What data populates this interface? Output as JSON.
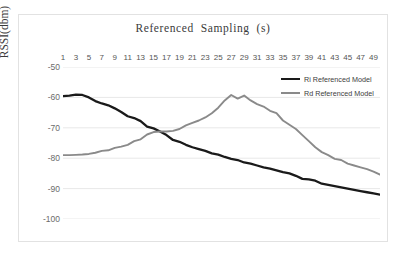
{
  "chart_data": {
    "type": "line",
    "title": "Referenced  Sampling  (s)",
    "xlabel": "",
    "ylabel": "RSSI(dbm)",
    "ylim": [
      -100,
      -50
    ],
    "xlim": [
      1,
      50
    ],
    "yticks": [
      "-50",
      "-60",
      "-70",
      "-80",
      "-90",
      "-100"
    ],
    "ytick_values": [
      -50,
      -60,
      -70,
      -80,
      -90,
      -100
    ],
    "grid": true,
    "legend_position": "top-right",
    "x": [
      1,
      2,
      3,
      4,
      5,
      6,
      7,
      8,
      9,
      10,
      11,
      12,
      13,
      14,
      15,
      16,
      17,
      18,
      19,
      20,
      21,
      22,
      23,
      24,
      25,
      26,
      27,
      28,
      29,
      30,
      31,
      32,
      33,
      34,
      35,
      36,
      37,
      38,
      39,
      40,
      41,
      42,
      43,
      44,
      45,
      46,
      47,
      48,
      49,
      50
    ],
    "xtick_labels": [
      "1",
      "3",
      "5",
      "7",
      "9",
      "11",
      "13",
      "15",
      "17",
      "19",
      "21",
      "23",
      "25",
      "27",
      "29",
      "31",
      "33",
      "35",
      "37",
      "39",
      "41",
      "43",
      "45",
      "47",
      "49"
    ],
    "series": [
      {
        "name": "Ri Referenced Model",
        "color": "#1a1a1a",
        "values": [
          -59.6,
          -59.4,
          -59.1,
          -59.2,
          -60.0,
          -61.2,
          -62.0,
          -62.6,
          -63.6,
          -64.8,
          -66.2,
          -66.8,
          -67.8,
          -69.6,
          -70.2,
          -71.2,
          -72.4,
          -74.0,
          -74.6,
          -75.6,
          -76.4,
          -77.0,
          -77.6,
          -78.4,
          -78.8,
          -79.6,
          -80.2,
          -80.6,
          -81.4,
          -81.8,
          -82.4,
          -83.0,
          -83.4,
          -84.0,
          -84.6,
          -85.0,
          -85.8,
          -86.8,
          -87.0,
          -87.4,
          -88.4,
          -88.8,
          -89.2,
          -89.6,
          -90.0,
          -90.4,
          -90.8,
          -91.2,
          -91.6,
          -92.0
        ]
      },
      {
        "name": "Rd Referenced Model",
        "color": "#8a8a8a",
        "values": [
          -79.0,
          -79.0,
          -78.9,
          -78.8,
          -78.6,
          -78.2,
          -77.6,
          -77.4,
          -76.6,
          -76.2,
          -75.6,
          -74.4,
          -73.8,
          -72.2,
          -71.4,
          -71.2,
          -71.2,
          -71.0,
          -70.4,
          -69.2,
          -68.4,
          -67.6,
          -66.6,
          -65.2,
          -63.4,
          -61.0,
          -59.2,
          -60.4,
          -59.4,
          -61.0,
          -62.2,
          -63.0,
          -64.4,
          -65.2,
          -67.6,
          -69.0,
          -70.4,
          -72.4,
          -74.4,
          -76.4,
          -78.0,
          -79.0,
          -80.2,
          -80.6,
          -81.8,
          -82.4,
          -83.0,
          -83.6,
          -84.4,
          -85.4
        ]
      }
    ]
  }
}
